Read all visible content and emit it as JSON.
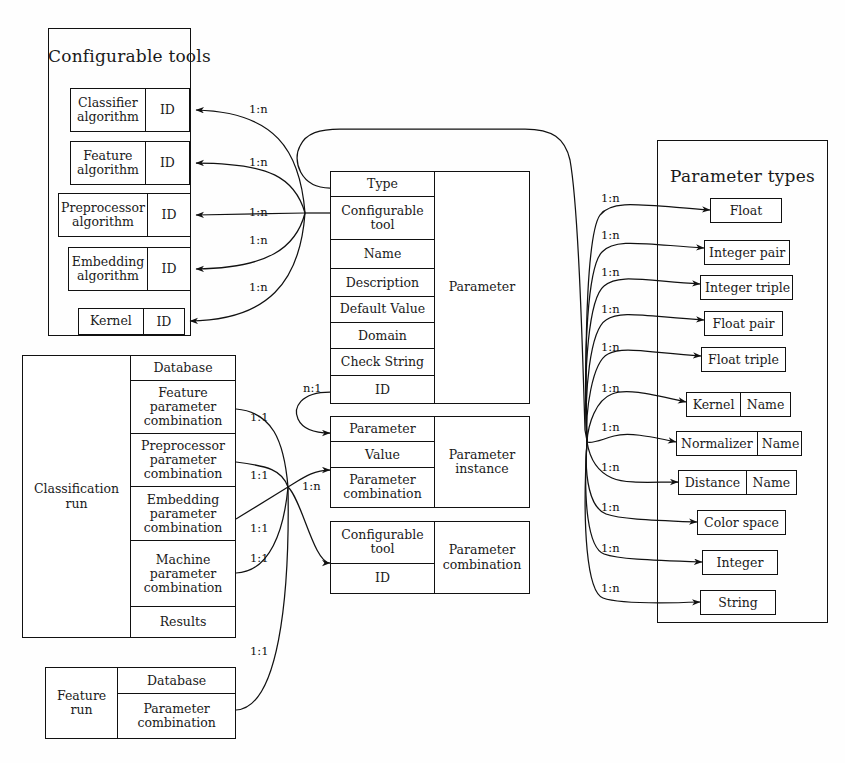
{
  "diagram": {
    "line_color": "#111111",
    "background": "#ffffff"
  },
  "configurable_tools": {
    "title": "Configurable tools",
    "entities": [
      {
        "name": "Classifier\nalgorithm",
        "attrs": [
          "ID"
        ]
      },
      {
        "name": "Feature\nalgorithm",
        "attrs": [
          "ID"
        ]
      },
      {
        "name": "Preprocessor\nalgorithm",
        "attrs": [
          "ID"
        ]
      },
      {
        "name": "Embedding\nalgorithm",
        "attrs": [
          "ID"
        ]
      },
      {
        "name": "Kernel",
        "attrs": [
          "ID"
        ]
      }
    ],
    "edge_labels": [
      "1:n",
      "1:n",
      "1:n",
      "1:n",
      "1:n"
    ]
  },
  "parameter": {
    "name": "Parameter",
    "attrs": [
      "Type",
      "Configurable\ntool",
      "Name",
      "Description",
      "Default Value",
      "Domain",
      "Check String",
      "ID"
    ],
    "self_label": "n:1"
  },
  "parameter_instance": {
    "name": "Parameter\ninstance",
    "attrs": [
      "Parameter",
      "Value",
      "Parameter\ncombination"
    ],
    "edge_label": "1:n"
  },
  "parameter_combination": {
    "name": "Parameter\ncombination",
    "attrs": [
      "Configurable\ntool",
      "ID"
    ]
  },
  "classification_run": {
    "name": "Classification\nrun",
    "attrs": [
      "Database",
      "Feature\nparameter\ncombination",
      "Preprocessor\nparameter\ncombination",
      "Embedding\nparameter\ncombination",
      "Machine\nparameter\ncombination",
      "Results"
    ],
    "edge_labels": [
      "1:1",
      "1:1",
      "1:1",
      "1:1"
    ]
  },
  "feature_run": {
    "name": "Feature\nrun",
    "attrs": [
      "Database",
      "Parameter\ncombination"
    ],
    "edge_label": "1:1"
  },
  "parameter_types": {
    "title": "Parameter types",
    "types": [
      {
        "label": "Float",
        "sub": null
      },
      {
        "label": "Integer pair",
        "sub": null
      },
      {
        "label": "Integer triple",
        "sub": null
      },
      {
        "label": "Float pair",
        "sub": null
      },
      {
        "label": "Float triple",
        "sub": null
      },
      {
        "label": "Kernel",
        "sub": "Name"
      },
      {
        "label": "Normalizer",
        "sub": "Name"
      },
      {
        "label": "Distance",
        "sub": "Name"
      },
      {
        "label": "Color space",
        "sub": null
      },
      {
        "label": "Integer",
        "sub": null
      },
      {
        "label": "String",
        "sub": null
      }
    ],
    "edge_labels": [
      "1:n",
      "1:n",
      "1:n",
      "1:n",
      "1:n",
      "1:n",
      "1:n",
      "1:n",
      "1:n",
      "1:n",
      "1:n"
    ]
  }
}
